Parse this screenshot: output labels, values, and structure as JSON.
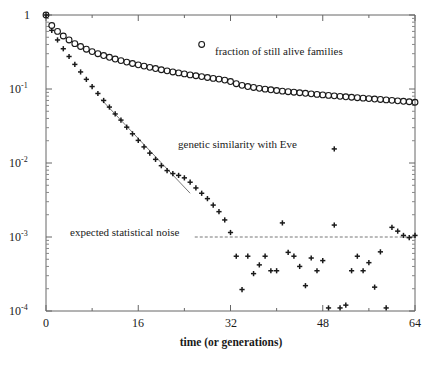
{
  "chart_data": {
    "type": "scatter",
    "title": "",
    "xlabel": "time (or generations)",
    "ylabel": "",
    "xlim": [
      0,
      64
    ],
    "ylim": [
      0.0001,
      1
    ],
    "yscale": "log",
    "xscale": "linear",
    "grid": false,
    "legend_position": "inside-upper-right",
    "xticks": [
      0,
      16,
      32,
      48,
      64
    ],
    "xticklabels": [
      "0",
      "16",
      "32",
      "48",
      "64"
    ],
    "xminorticks": [
      8,
      24,
      40,
      56
    ],
    "yticks": [
      1,
      0.1,
      0.01,
      0.001,
      0.0001
    ],
    "yticklabels": [
      "1",
      "10-1",
      "10-2",
      "10-3",
      "10-4"
    ],
    "ytick_mantissa": [
      "1",
      "10",
      "10",
      "10",
      "10"
    ],
    "ytick_exponent": [
      "",
      "-1",
      "-2",
      "-3",
      "-4"
    ],
    "series": [
      {
        "name": "fraction of still alive families",
        "marker": "circle",
        "color": "#1a1a1a",
        "x": [
          0,
          1,
          2,
          3,
          4,
          5,
          6,
          7,
          8,
          9,
          10,
          11,
          12,
          13,
          14,
          15,
          16,
          17,
          18,
          19,
          20,
          21,
          22,
          23,
          24,
          25,
          26,
          27,
          28,
          29,
          30,
          31,
          32,
          33,
          34,
          35,
          36,
          37,
          38,
          39,
          40,
          41,
          42,
          43,
          44,
          45,
          46,
          47,
          48,
          49,
          50,
          51,
          52,
          53,
          54,
          55,
          56,
          57,
          58,
          59,
          60,
          61,
          62,
          63,
          64
        ],
        "y": [
          1.0,
          0.72,
          0.6,
          0.52,
          0.46,
          0.41,
          0.375,
          0.345,
          0.32,
          0.3,
          0.283,
          0.268,
          0.254,
          0.242,
          0.231,
          0.221,
          0.212,
          0.204,
          0.196,
          0.189,
          0.182,
          0.176,
          0.17,
          0.165,
          0.16,
          0.155,
          0.151,
          0.147,
          0.143,
          0.139,
          0.136,
          0.132,
          0.126,
          0.118,
          0.112,
          0.108,
          0.105,
          0.102,
          0.0995,
          0.0975,
          0.0955,
          0.0935,
          0.092,
          0.0905,
          0.089,
          0.0875,
          0.086,
          0.0845,
          0.0832,
          0.082,
          0.0808,
          0.0796,
          0.0785,
          0.0774,
          0.0763,
          0.0752,
          0.0742,
          0.0732,
          0.0722,
          0.0712,
          0.0702,
          0.0692,
          0.0682,
          0.0672,
          0.0662
        ]
      },
      {
        "name": "genetic similarity with Eve",
        "marker": "plus",
        "color": "#1a1a1a",
        "x": [
          0,
          1,
          2,
          3,
          4,
          5,
          6,
          7,
          8,
          9,
          10,
          11,
          12,
          13,
          14,
          15,
          16,
          17,
          18,
          19,
          20,
          21,
          22,
          23,
          24,
          25,
          26,
          27,
          28,
          29,
          30,
          31,
          32,
          33,
          34,
          35,
          36,
          37,
          38,
          39,
          40,
          41,
          42,
          43,
          44,
          45,
          46,
          47,
          48,
          49,
          50,
          51,
          52,
          53,
          54,
          55,
          56,
          57,
          58,
          59,
          60,
          61,
          62,
          63,
          64
        ],
        "y": [
          1.0,
          0.62,
          0.46,
          0.35,
          0.275,
          0.215,
          0.17,
          0.135,
          0.108,
          0.087,
          0.07,
          0.057,
          0.046,
          0.038,
          0.0305,
          0.0248,
          0.0202,
          0.0165,
          0.0136,
          0.0112,
          0.0092,
          0.0079,
          0.0072,
          0.0068,
          0.0063,
          0.0055,
          0.0046,
          0.0039,
          0.0033,
          0.0027,
          0.0022,
          0.0017,
          0.00115,
          0.00055,
          0.000195,
          0.00055,
          0.00032,
          0.00042,
          0.00055,
          0.00035,
          0.00035,
          0.00155,
          0.00062,
          0.00055,
          0.0004,
          0.00022,
          0.00052,
          0.00035,
          0.00048,
          0.00011,
          0.00145,
          0.00011,
          0.00012,
          0.00035,
          0.00055,
          0.00035,
          0.00045,
          0.00021,
          0.00063,
          0.00011,
          0.00135,
          0.0012,
          0.00105,
          0.00098,
          0.00105
        ]
      }
    ],
    "reference_lines": [
      {
        "name": "expected statistical noise",
        "style": "dashed",
        "y": 0.001,
        "x_start": 25.8,
        "x_end": 64
      },
      {
        "name": "exponential-fit-guide",
        "style": "solid",
        "x_start": 9.6,
        "y_start": 0.072,
        "x_end": 25.0,
        "y_end": 0.0039
      }
    ],
    "annotations": [
      {
        "name": "noise-label",
        "text": "expected statistical noise",
        "x": 4.2,
        "y": 0.00118
      },
      {
        "name": "eve-label",
        "text": "genetic similarity with Eve",
        "x": 23.5,
        "y": 0.0155
      }
    ],
    "legend": [
      {
        "name": "fraction of still alive families",
        "marker": "circle",
        "x": 27.0,
        "y": 0.4
      },
      {
        "name": "genetic similarity with Eve",
        "marker": "plus",
        "x": 50.0,
        "y": 0.0155
      }
    ]
  }
}
